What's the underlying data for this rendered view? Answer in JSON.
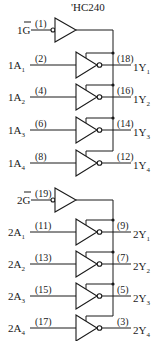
{
  "title": "'HC240",
  "groups": [
    {
      "enable": {
        "label": "1G",
        "prefix": "1",
        "letter": "G",
        "overbar": true,
        "pin": "(1)",
        "y": 30
      },
      "bus_x": 113,
      "channels": [
        {
          "input": {
            "prefix": "1A",
            "sub": "1",
            "pin": "(2)"
          },
          "output": {
            "prefix": "1Y",
            "sub": "1",
            "pin": "(18)"
          },
          "y": 65
        },
        {
          "input": {
            "prefix": "1A",
            "sub": "2",
            "pin": "(4)"
          },
          "output": {
            "prefix": "1Y",
            "sub": "2",
            "pin": "(16)"
          },
          "y": 97
        },
        {
          "input": {
            "prefix": "1A",
            "sub": "3",
            "pin": "(6)"
          },
          "output": {
            "prefix": "1Y",
            "sub": "3",
            "pin": "(14)"
          },
          "y": 130
        },
        {
          "input": {
            "prefix": "1A",
            "sub": "4",
            "pin": "(8)"
          },
          "output": {
            "prefix": "1Y",
            "sub": "4",
            "pin": "(12)"
          },
          "y": 163
        }
      ]
    },
    {
      "enable": {
        "label": "2G",
        "prefix": "2",
        "letter": "G",
        "overbar": true,
        "pin": "(19)",
        "y": 200
      },
      "bus_x": 113,
      "channels": [
        {
          "input": {
            "prefix": "2A",
            "sub": "1",
            "pin": "(11)"
          },
          "output": {
            "prefix": "2Y",
            "sub": "1",
            "pin": "(9)"
          },
          "y": 232
        },
        {
          "input": {
            "prefix": "2A",
            "sub": "2",
            "pin": "(13)"
          },
          "output": {
            "prefix": "2Y",
            "sub": "2",
            "pin": "(7)"
          },
          "y": 264
        },
        {
          "input": {
            "prefix": "2A",
            "sub": "3",
            "pin": "(15)"
          },
          "output": {
            "prefix": "2Y",
            "sub": "3",
            "pin": "(5)"
          },
          "y": 296
        },
        {
          "input": {
            "prefix": "2A",
            "sub": "4",
            "pin": "(17)"
          },
          "output": {
            "prefix": "2Y",
            "sub": "4",
            "pin": "(3)"
          },
          "y": 328
        }
      ]
    }
  ],
  "colors": {
    "ink": "#1a1a1a",
    "background": "#ffffff"
  }
}
